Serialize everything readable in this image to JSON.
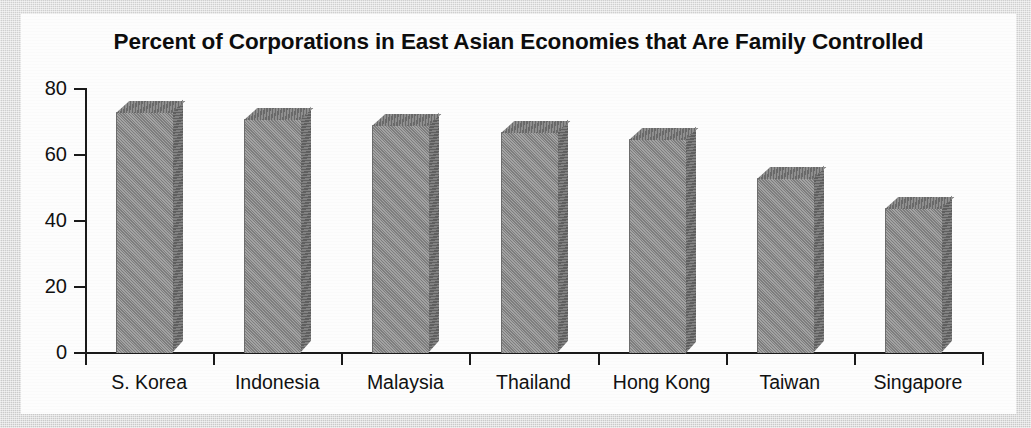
{
  "chart_data": {
    "type": "bar",
    "title": "Percent of Corporations in East Asian Economies that Are Family Controlled",
    "xlabel": "",
    "ylabel": "",
    "categories": [
      "S. Korea",
      "Indonesia",
      "Malaysia",
      "Thailand",
      "Hong Kong",
      "Taiwan",
      "Singapore"
    ],
    "values": [
      73,
      71,
      69,
      67,
      65,
      53,
      44
    ],
    "ylim": [
      0,
      80
    ],
    "yticks": [
      0,
      20,
      40,
      60,
      80
    ],
    "ytick_labels": [
      "0",
      "20",
      "40",
      "60",
      "80"
    ],
    "grid": false,
    "legend": null,
    "series": [
      {
        "name": "Percent family controlled",
        "values": [
          73,
          71,
          69,
          67,
          65,
          53,
          44
        ]
      }
    ],
    "style": {
      "bar_face_color": "#8c8c8c",
      "bar_top_color": "#787878",
      "bar_side_color": "#6f6f6f",
      "axis_color": "#1a1a1a",
      "panel_color": "#fdfdfd",
      "surround_color": "#cfcfcf",
      "text_color": "#111111"
    }
  }
}
